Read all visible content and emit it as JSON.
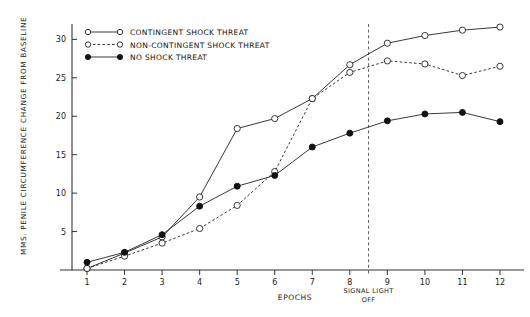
{
  "chart_data": {
    "type": "line",
    "title": "",
    "xlabel": "EPOCHS",
    "ylabel": "MMS. PENILE CIRCUMFERENCE CHANGE FROM BASELINE",
    "x": [
      1,
      2,
      3,
      4,
      5,
      6,
      7,
      8,
      9,
      10,
      11,
      12
    ],
    "categories": [
      "1",
      "2",
      "3",
      "4",
      "5",
      "6",
      "7",
      "8",
      "9",
      "10",
      "11",
      "12"
    ],
    "xlim": [
      0.6,
      12.4
    ],
    "ylim": [
      0,
      32
    ],
    "xticks": [
      "1",
      "2",
      "3",
      "4",
      "5",
      "6",
      "7",
      "8",
      "9",
      "10",
      "11",
      "12"
    ],
    "yticks": [
      "5",
      "10",
      "15",
      "20",
      "25",
      "30"
    ],
    "ytick_values": [
      5,
      10,
      15,
      20,
      25,
      30
    ],
    "grid": false,
    "legend_position": "top-left",
    "series": [
      {
        "name": "Contingent Shock Threat",
        "marker": "open-circle",
        "line_style": "solid",
        "color": "#222222",
        "values": [
          0.2,
          2.2,
          4.3,
          9.5,
          18.4,
          19.7,
          22.3,
          26.7,
          29.5,
          30.5,
          31.2,
          31.6
        ]
      },
      {
        "name": "Non-contingent Shock Threat",
        "marker": "open-circle",
        "line_style": "dashed",
        "color": "#222222",
        "values": [
          0.2,
          1.8,
          3.5,
          5.4,
          8.4,
          12.8,
          22.3,
          25.7,
          27.2,
          26.8,
          25.3,
          26.5
        ]
      },
      {
        "name": "No Shock Threat",
        "marker": "filled-circle",
        "line_style": "solid",
        "color": "#111111",
        "values": [
          1.0,
          2.3,
          4.6,
          8.3,
          10.9,
          12.3,
          16.0,
          17.8,
          19.4,
          20.3,
          20.5,
          19.3
        ]
      }
    ],
    "annotations": [
      {
        "name": "signal-light-off",
        "text_line1": "Signal Light",
        "text_line2": "Off",
        "x_value": 8.5,
        "style": "vertical-dashed-line"
      }
    ]
  },
  "legend": {
    "items": [
      {
        "label": "Contingent Shock Threat",
        "marker": "open-circle",
        "line_style": "solid"
      },
      {
        "label": "Non-contingent Shock Threat",
        "marker": "open-circle",
        "line_style": "dashed"
      },
      {
        "label": "No Shock Threat",
        "marker": "filled-circle",
        "line_style": "solid"
      }
    ]
  },
  "colors": {
    "background": "#ffffff",
    "ink": "#222222",
    "marker_fill_open": "#ffffff",
    "marker_fill_solid": "#111111"
  }
}
